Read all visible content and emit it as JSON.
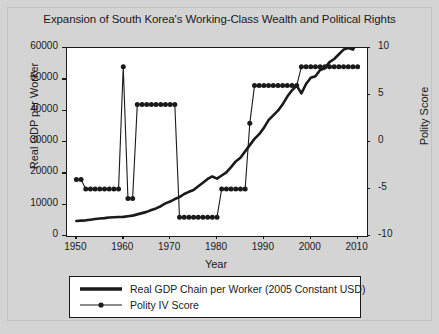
{
  "chart_data": {
    "type": "line",
    "title": "Expansion of South Korea's Working-Class Wealth and Political Rights",
    "xlabel": "Year",
    "ylabel": "Real GDP per Worker",
    "ylabel_right": "Polity Score",
    "xlim": [
      1948,
      2012
    ],
    "ylim": [
      0,
      60000
    ],
    "ylim_right": [
      -10,
      10
    ],
    "xticks": [
      1950,
      1960,
      1970,
      1980,
      1990,
      2000,
      2010
    ],
    "yticks": [
      0,
      10000,
      20000,
      30000,
      40000,
      50000,
      60000
    ],
    "yticks_right": [
      -10,
      -5,
      0,
      5,
      10
    ],
    "grid": false,
    "legend_position": "below-axes",
    "colors": {
      "line": "#1a1a1a",
      "marker": "#1a1a1a",
      "plot_bg": "#ffffff",
      "figure_bg": "#d4d4d4"
    },
    "series": [
      {
        "name": "Real GDP Chain per Worker (2005 Constant USD)",
        "axis": "left",
        "marker": "none",
        "x": [
          1950,
          1951,
          1952,
          1953,
          1954,
          1955,
          1956,
          1957,
          1958,
          1959,
          1960,
          1961,
          1962,
          1963,
          1964,
          1965,
          1966,
          1967,
          1968,
          1969,
          1970,
          1971,
          1972,
          1973,
          1974,
          1975,
          1976,
          1977,
          1978,
          1979,
          1980,
          1981,
          1982,
          1983,
          1984,
          1985,
          1986,
          1987,
          1988,
          1989,
          1990,
          1991,
          1992,
          1993,
          1994,
          1995,
          1996,
          1997,
          1998,
          1999,
          2000,
          2001,
          2002,
          2003,
          2004,
          2005,
          2006,
          2007,
          2008,
          2009,
          2010
        ],
        "y": [
          4800,
          4900,
          5000,
          5200,
          5400,
          5600,
          5700,
          5900,
          6000,
          6050,
          6100,
          6300,
          6500,
          6900,
          7300,
          7700,
          8300,
          8800,
          9500,
          10400,
          11000,
          11800,
          12400,
          13400,
          14100,
          14700,
          15900,
          17000,
          18200,
          19000,
          18300,
          19300,
          20300,
          22000,
          23800,
          25000,
          27000,
          29000,
          31000,
          32500,
          34500,
          37000,
          38500,
          40000,
          42000,
          44500,
          46500,
          48000,
          45500,
          48500,
          50500,
          51000,
          53000,
          53500,
          55500,
          56500,
          58000,
          59500,
          60000,
          59500,
          62000
        ]
      },
      {
        "name": "Polity IV Score",
        "axis": "right",
        "marker": "circle",
        "x": [
          1950,
          1951,
          1952,
          1953,
          1954,
          1955,
          1956,
          1957,
          1958,
          1959,
          1960,
          1961,
          1962,
          1963,
          1964,
          1965,
          1966,
          1967,
          1968,
          1969,
          1970,
          1971,
          1972,
          1973,
          1974,
          1975,
          1976,
          1977,
          1978,
          1979,
          1980,
          1981,
          1982,
          1983,
          1984,
          1985,
          1986,
          1987,
          1988,
          1989,
          1990,
          1991,
          1992,
          1993,
          1994,
          1995,
          1996,
          1997,
          1998,
          1999,
          2000,
          2001,
          2002,
          2003,
          2004,
          2005,
          2006,
          2007,
          2008,
          2009,
          2010
        ],
        "y": [
          -4,
          -4,
          -5,
          -5,
          -5,
          -5,
          -5,
          -5,
          -5,
          -5,
          8,
          -6,
          -6,
          4,
          4,
          4,
          4,
          4,
          4,
          4,
          4,
          4,
          -8,
          -8,
          -8,
          -8,
          -8,
          -8,
          -8,
          -8,
          -8,
          -5,
          -5,
          -5,
          -5,
          -5,
          -5,
          2,
          6,
          6,
          6,
          6,
          6,
          6,
          6,
          6,
          6,
          6,
          8,
          8,
          8,
          8,
          8,
          8,
          8,
          8,
          8,
          8,
          8,
          8,
          8
        ]
      }
    ]
  },
  "legend": {
    "items": [
      {
        "label": "Real GDP Chain per Worker (2005 Constant USD)",
        "style": "thick-line"
      },
      {
        "label": "Polity IV Score",
        "style": "line-with-marker"
      }
    ]
  }
}
